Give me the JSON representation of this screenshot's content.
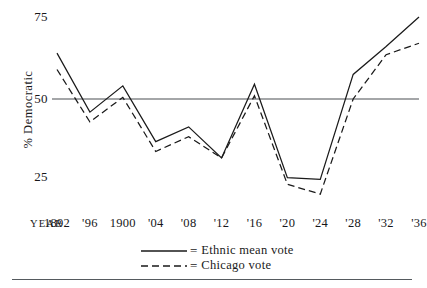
{
  "chart_data": {
    "type": "line",
    "title": "",
    "xlabel": "YEAR",
    "ylabel": "% Democratic",
    "ylim": [
      15,
      78
    ],
    "yticks": [
      75,
      50,
      25
    ],
    "grid": false,
    "reference_line": 50,
    "legend_position": "bottom-center",
    "x": [
      1892,
      1896,
      1900,
      1904,
      1908,
      1912,
      1916,
      1920,
      1924,
      1928,
      1932,
      1936
    ],
    "categories": [
      "1892",
      "'96",
      "1900",
      "'04",
      "'08",
      "'12",
      "'16",
      "'20",
      "'24",
      "'28",
      "'32",
      "'36"
    ],
    "series": [
      {
        "name": "Ethnic mean vote",
        "style": "solid",
        "color": "#1a1a1a",
        "values": [
          64,
          46,
          54,
          37,
          41.5,
          32,
          54.5,
          26,
          25.5,
          57.5,
          66,
          75
        ]
      },
      {
        "name": "Chicago vote",
        "style": "dashed",
        "color": "#1a1a1a",
        "values": [
          59,
          43,
          50.5,
          34,
          38.5,
          32,
          51,
          24,
          21,
          50,
          63.5,
          67
        ]
      }
    ]
  },
  "axes": {
    "y_title": "% Democratic",
    "y_ticks": [
      "75",
      "50",
      "25"
    ],
    "x_title": "YEAR",
    "x_ticks": [
      "1892",
      "'96",
      "1900",
      "'04",
      "'08",
      "'12",
      "'16",
      "'20",
      "'24",
      "'28",
      "'32",
      "'36"
    ]
  },
  "legend": {
    "equals": "=",
    "entries": [
      {
        "label": "Ethnic mean vote",
        "style": "solid"
      },
      {
        "label": "Chicago vote",
        "style": "dashed"
      }
    ]
  },
  "colors": {
    "line": "#1a1a1a",
    "reference_line": "#4a4e52",
    "rule": "#555a5e",
    "text": "#17171a",
    "background": "#ffffff"
  }
}
